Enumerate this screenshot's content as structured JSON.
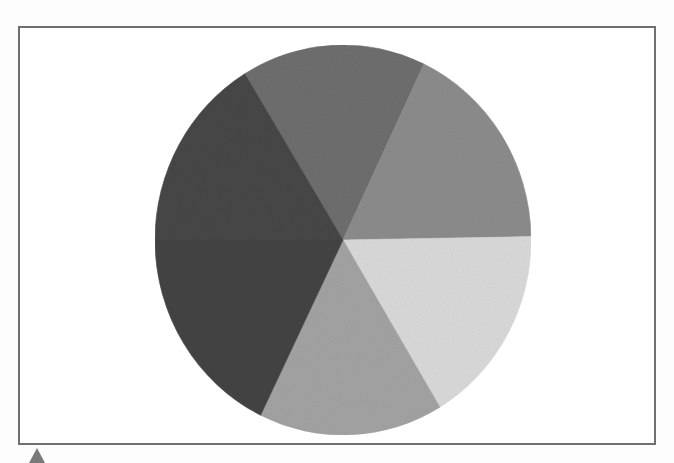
{
  "image": {
    "description": "Photograph of a painted pie/circle artwork divided into six wedge regions with a thin frame",
    "background_color": "#fdfdfd",
    "frame_color": "#6f6f6f"
  },
  "pie": {
    "center": [
      343,
      240
    ],
    "rx": 188,
    "ry": 195,
    "slices": [
      {
        "name": "top-medium-gray",
        "start_deg": -31.5,
        "end_deg": 25.5,
        "color": "#6e6e6e"
      },
      {
        "name": "upper-right-gray",
        "start_deg": 25.5,
        "end_deg": 89.0,
        "color": "#8c8c8c"
      },
      {
        "name": "lower-right-light",
        "start_deg": 89.0,
        "end_deg": 149.0,
        "color": "#d9d9d9"
      },
      {
        "name": "bottom-textured-gray",
        "start_deg": 149.0,
        "end_deg": 206.0,
        "color": "#a3a3a3"
      },
      {
        "name": "lower-left-dark",
        "start_deg": 206.0,
        "end_deg": 270.0,
        "color": "#444444"
      },
      {
        "name": "upper-left-dark",
        "start_deg": 270.0,
        "end_deg": 328.5,
        "color": "#474747"
      }
    ]
  },
  "marker": {
    "shape": "triangle-up",
    "color": "#7a7a7a"
  }
}
